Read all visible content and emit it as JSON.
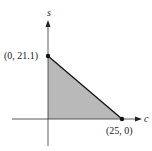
{
  "diagram": {
    "type": "feasible-region",
    "axes": {
      "x_label": "c",
      "y_label": "s"
    },
    "vertices": [
      {
        "label": "(0, 21.1)",
        "x": 0,
        "y": 21.1
      },
      {
        "label": "(25, 0)",
        "x": 25,
        "y": 0
      }
    ],
    "region_color": "#b8b8b8",
    "line_color": "#111111"
  }
}
